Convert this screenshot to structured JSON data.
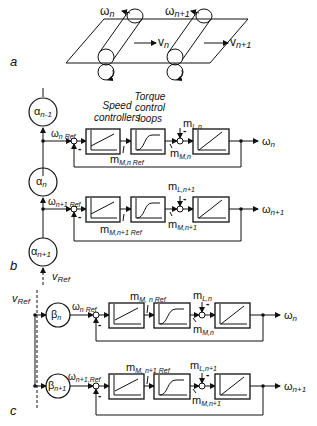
{
  "figure": {
    "panel_a": {
      "label": "a",
      "omega_n": "ω",
      "omega_n_sub": "n",
      "omega_n1": "ω",
      "omega_n1_sub": "n+1",
      "v_n": "v",
      "v_n_sub": "n",
      "v_n1": "v",
      "v_n1_sub": "n+1"
    },
    "panel_b": {
      "label": "b",
      "speed_controllers_line1": "Speed",
      "speed_controllers_line2": "controllers",
      "torque_line1": "Torque",
      "torque_line2": "control",
      "torque_line3": "loops",
      "alpha_prev": "α",
      "alpha_prev_sub": "n-1",
      "alpha_n": "α",
      "alpha_n_sub": "n",
      "alpha_next": "α",
      "alpha_next_sub": "n+1",
      "v_ref": "v",
      "v_ref_sub": "Ref",
      "rows": [
        {
          "omega_ref": "ω",
          "omega_ref_sub": "n Ref",
          "m_ref": "m",
          "m_ref_sub": "M,n Ref",
          "m_L": "m",
          "m_L_sub": "L,n",
          "m_M": "m",
          "m_M_sub": "M,n",
          "omega_out": "ω",
          "omega_out_sub": "n",
          "minus": "-"
        },
        {
          "omega_ref": "ω",
          "omega_ref_sub": "n+1 Ref",
          "m_ref": "m",
          "m_ref_sub": "M,n+1 Ref",
          "m_L": "m",
          "m_L_sub": "L,n+1",
          "m_M": "m",
          "m_M_sub": "M,n+1",
          "omega_out": "ω",
          "omega_out_sub": "n+1",
          "minus": "-"
        }
      ]
    },
    "panel_c": {
      "label": "c",
      "v_ref": "v",
      "v_ref_sub": "Ref",
      "rows": [
        {
          "beta": "β",
          "beta_sub": "n",
          "omega_ref": "ω",
          "omega_ref_sub": "n Ref",
          "m_ref": "m",
          "m_ref_sub": "M, n Ref",
          "m_L": "m",
          "m_L_sub": "L,n",
          "m_M": "m",
          "m_M_sub": "M,n",
          "omega_out": "ω",
          "omega_out_sub": "n",
          "minus": "-"
        },
        {
          "beta": "β",
          "beta_sub": "n+1",
          "omega_ref": "ω",
          "omega_ref_sub": "n+1,Ref",
          "m_ref": "m",
          "m_ref_sub": "M, n+1 Ref",
          "m_L": "m",
          "m_L_sub": "L,n+1",
          "m_M": "m",
          "m_M_sub": "M,n+1",
          "omega_out": "ω",
          "omega_out_sub": "n+1",
          "minus": "-"
        }
      ]
    }
  }
}
